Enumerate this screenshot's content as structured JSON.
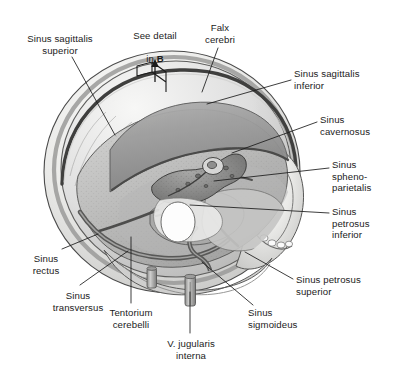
{
  "figure": {
    "background_color": "#ffffff",
    "line_color": "#1b1b1b",
    "text_color": "#1b1b1b",
    "palette": {
      "bone_light": "#f2f2f0",
      "bone_mid": "#d8d8d6",
      "bone_shadow": "#b4b4b2",
      "dura_gray": "#9d9d9d",
      "dura_dark": "#6e6e6e",
      "sinus_dark": "#5a5a5a",
      "outline": "#3a3a3a",
      "highlight": "#ffffff"
    }
  },
  "detail_marker": {
    "text_line1": "See detail",
    "text_line2_prefix": "in ",
    "text_line2_bold": "B",
    "icon": "view-direction-arrow-icon"
  },
  "labels": [
    {
      "id": "sinus-sagittalis-superior",
      "text": "Sinus sagittalis\nsuperior",
      "align": "center",
      "x": 8,
      "y": 33,
      "w": 104
    },
    {
      "id": "falx-cerebri",
      "text": "Falx\ncerebri",
      "align": "center",
      "x": 196,
      "y": 22,
      "w": 48
    },
    {
      "id": "sinus-sagittalis-inferior",
      "text": "Sinus sagittalis\ninferior",
      "align": "left",
      "x": 294,
      "y": 68,
      "w": 98
    },
    {
      "id": "sinus-cavernosus",
      "text": "Sinus\ncavernosus",
      "align": "left",
      "x": 320,
      "y": 114,
      "w": 72
    },
    {
      "id": "sinus-sphenoparietalis",
      "text": "Sinus\nspheno-\nparietalis",
      "align": "left",
      "x": 332,
      "y": 159,
      "w": 60
    },
    {
      "id": "sinus-petrosus-inferior",
      "text": "Sinus\npetrosus\ninferior",
      "align": "left",
      "x": 332,
      "y": 206,
      "w": 60
    },
    {
      "id": "sinus-petrosus-superior",
      "text": "Sinus petrosus\nsuperior",
      "align": "left",
      "x": 296,
      "y": 274,
      "w": 96
    },
    {
      "id": "sinus-sigmoideus",
      "text": "Sinus\nsigmoideus",
      "align": "left",
      "x": 248,
      "y": 307,
      "w": 72
    },
    {
      "id": "vena-jugularis-interna",
      "text": "V. jugularis\ninterna",
      "align": "center",
      "x": 150,
      "y": 338,
      "w": 82
    },
    {
      "id": "tentorium-cerebelli",
      "text": "Tentorium\ncerebelli",
      "align": "center",
      "x": 96,
      "y": 307,
      "w": 70
    },
    {
      "id": "sinus-transversus",
      "text": "Sinus\ntransversus",
      "align": "center",
      "x": 40,
      "y": 290,
      "w": 76
    },
    {
      "id": "sinus-rectus",
      "text": "Sinus\nrectus",
      "align": "center",
      "x": 18,
      "y": 253,
      "w": 56
    }
  ],
  "leader_lines": [
    {
      "id": "leader-sinus-sagittalis-superior",
      "points": "72,57 115,135"
    },
    {
      "id": "leader-falx-cerebri",
      "points": "218,48 202,92"
    },
    {
      "id": "leader-sinus-sagittalis-inferior",
      "points": "291,80 207,104"
    },
    {
      "id": "leader-sinus-cavernosus",
      "points": "317,122 232,153"
    },
    {
      "id": "leader-sinus-sphenoparietalis",
      "points": "329,168 214,181"
    },
    {
      "id": "leader-sinus-petrosus-inferior",
      "points": "329,213 190,205"
    },
    {
      "id": "leader-sinus-petrosus-superior",
      "points": "293,279 245,252"
    },
    {
      "id": "leader-sinus-sigmoideus",
      "points": "253,305 202,262"
    },
    {
      "id": "leader-vena-jugularis-interna",
      "points": "190,333 190,292"
    },
    {
      "id": "leader-tentorium-cerebelli",
      "points": "131,303 131,237"
    },
    {
      "id": "leader-sinus-transversus",
      "points": "80,285 128,251"
    },
    {
      "id": "leader-sinus-rectus",
      "points": "62,249 98,234"
    }
  ]
}
